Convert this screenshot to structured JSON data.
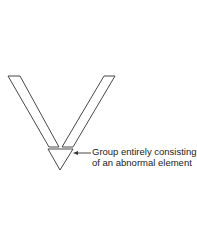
{
  "diagram": {
    "annotation": {
      "line1": "Group entirely consisting",
      "line2": "of an abnormal element"
    },
    "shapes": {
      "left_bar": "left diagonal bar",
      "right_bar": "right diagonal bar",
      "triangle": "inverted triangle"
    },
    "colors": {
      "stroke": "#333333",
      "background": "#ffffff"
    }
  }
}
